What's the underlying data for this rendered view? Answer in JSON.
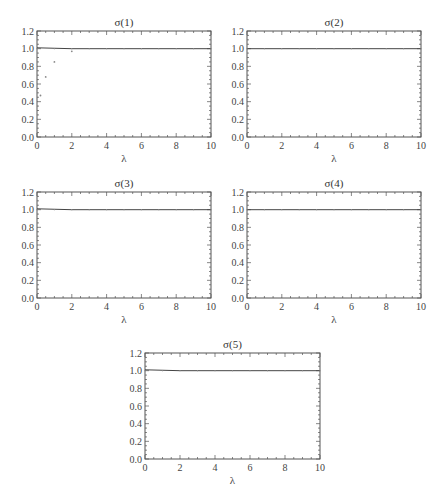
{
  "chart_data": [
    {
      "type": "line",
      "title": "σ(1)",
      "xlabel": "λ",
      "ylabel": "",
      "xlim": [
        0,
        10
      ],
      "ylim": [
        0,
        1.2
      ],
      "xticks": [
        0,
        2,
        4,
        6,
        8,
        10
      ],
      "yticks": [
        "0.0",
        "0.2",
        "0.4",
        "0.6",
        "0.8",
        "1.0",
        "1.2"
      ],
      "grid": false,
      "series": [
        {
          "name": "σ(1)",
          "x": [
            0,
            2,
            4,
            6,
            8,
            10
          ],
          "values": [
            1.01,
            1.0,
            1.0,
            1.0,
            1.0,
            1.0
          ]
        },
        {
          "name": "points",
          "style": "scatter",
          "x": [
            0.2,
            0.5,
            1.0,
            2.0
          ],
          "values": [
            0.47,
            0.68,
            0.85,
            0.97
          ]
        }
      ]
    },
    {
      "type": "line",
      "title": "σ(2)",
      "xlabel": "λ",
      "ylabel": "",
      "xlim": [
        0,
        10
      ],
      "ylim": [
        0,
        1.2
      ],
      "xticks": [
        0,
        2,
        4,
        6,
        8,
        10
      ],
      "yticks": [
        "0.0",
        "0.2",
        "0.4",
        "0.6",
        "0.8",
        "1.0",
        "1.2"
      ],
      "grid": false,
      "series": [
        {
          "name": "σ(2)",
          "x": [
            0,
            2,
            4,
            6,
            8,
            10
          ],
          "values": [
            1.0,
            1.0,
            1.0,
            1.0,
            1.0,
            1.0
          ]
        }
      ]
    },
    {
      "type": "line",
      "title": "σ(3)",
      "xlabel": "λ",
      "ylabel": "",
      "xlim": [
        0,
        10
      ],
      "ylim": [
        0,
        1.2
      ],
      "xticks": [
        0,
        2,
        4,
        6,
        8,
        10
      ],
      "yticks": [
        "0.0",
        "0.2",
        "0.4",
        "0.6",
        "0.8",
        "1.0",
        "1.2"
      ],
      "grid": false,
      "series": [
        {
          "name": "σ(3)",
          "x": [
            0,
            2,
            4,
            6,
            8,
            10
          ],
          "values": [
            1.01,
            1.0,
            1.0,
            1.0,
            1.0,
            1.0
          ]
        }
      ]
    },
    {
      "type": "line",
      "title": "σ(4)",
      "xlabel": "λ",
      "ylabel": "",
      "xlim": [
        0,
        10
      ],
      "ylim": [
        0,
        1.2
      ],
      "xticks": [
        0,
        2,
        4,
        6,
        8,
        10
      ],
      "yticks": [
        "0.0",
        "0.2",
        "0.4",
        "0.6",
        "0.8",
        "1.0",
        "1.2"
      ],
      "grid": false,
      "series": [
        {
          "name": "σ(4)",
          "x": [
            0,
            2,
            4,
            6,
            8,
            10
          ],
          "values": [
            1.0,
            1.0,
            1.0,
            1.0,
            1.0,
            1.0
          ]
        }
      ]
    },
    {
      "type": "line",
      "title": "σ(5)",
      "xlabel": "λ",
      "ylabel": "",
      "xlim": [
        0,
        10
      ],
      "ylim": [
        0,
        1.2
      ],
      "xticks": [
        0,
        2,
        4,
        6,
        8,
        10
      ],
      "yticks": [
        "0.0",
        "0.2",
        "0.4",
        "0.6",
        "0.8",
        "1.0",
        "1.2"
      ],
      "grid": false,
      "series": [
        {
          "name": "σ(5)",
          "x": [
            0,
            2,
            4,
            6,
            8,
            10
          ],
          "values": [
            1.01,
            1.0,
            1.0,
            1.0,
            1.0,
            1.0
          ]
        }
      ]
    }
  ],
  "layout": {
    "panels": [
      {
        "left": 37,
        "top": 31,
        "width": 174,
        "height": 106
      },
      {
        "left": 247,
        "top": 31,
        "width": 174,
        "height": 106
      },
      {
        "left": 37,
        "top": 192,
        "width": 174,
        "height": 106
      },
      {
        "left": 247,
        "top": 192,
        "width": 174,
        "height": 106
      },
      {
        "left": 145,
        "top": 353,
        "width": 175,
        "height": 106
      }
    ],
    "colors": {
      "frame": "#555555",
      "line": "#444444",
      "point": "#888888",
      "text": "#333333"
    }
  }
}
